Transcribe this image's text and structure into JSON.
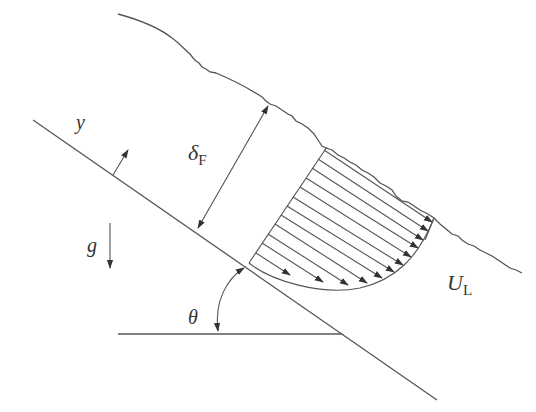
{
  "diagram": {
    "colors": {
      "stroke": "#555555",
      "text": "#333333",
      "background": "#ffffff"
    },
    "labels": {
      "y_axis": "y",
      "film_thickness_symbol": "δ",
      "film_thickness_sub": "F",
      "gravity": "g",
      "angle": "θ",
      "velocity_symbol": "U",
      "velocity_sub": "L"
    },
    "elements": [
      {
        "name": "inclined-wall",
        "description": "straight wall line sloping down to the right"
      },
      {
        "name": "free-surface",
        "description": "wavy liquid free surface parallel to wall"
      },
      {
        "name": "film-thickness-arrow",
        "description": "double-headed arrow perpendicular to wall labeled δF"
      },
      {
        "name": "y-axis-arrow",
        "description": "arrow normal to wall labeled y"
      },
      {
        "name": "gravity-arrow",
        "description": "downward vertical arrow labeled g"
      },
      {
        "name": "angle-arc",
        "description": "double-headed arc between horizontal and wall labeled θ"
      },
      {
        "name": "velocity-profile",
        "description": "parabolic velocity profile with 12 arrows parallel to wall, labeled UL"
      }
    ],
    "velocity_profile_arrow_count": 12
  }
}
